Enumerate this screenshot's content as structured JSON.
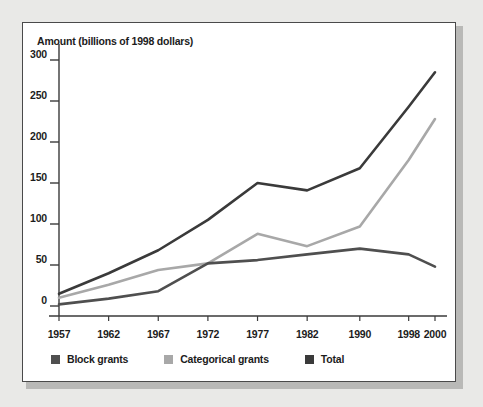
{
  "figure": {
    "panel_background": "#ffffff",
    "page_background": "#e9e9e7",
    "border_color": "#4a4a4a"
  },
  "chart_data": {
    "type": "line",
    "title": "Amount (billions of 1998 dollars)",
    "xlabel": "",
    "ylabel": "Amount (billions of 1998 dollars)",
    "categories": [
      "1957",
      "1962",
      "1967",
      "1972",
      "1977",
      "1982",
      "1990",
      "1998",
      "2000"
    ],
    "x": [
      1957,
      1962,
      1967,
      1972,
      1977,
      1982,
      1990,
      1998,
      2000
    ],
    "ylim": [
      0,
      300
    ],
    "yticks": [
      0,
      50,
      100,
      150,
      200,
      250,
      300
    ],
    "grid": false,
    "legend_position": "bottom-left",
    "series": [
      {
        "name": "Block grants",
        "color": "#4f4f4f",
        "values": [
          2,
          9,
          18,
          52,
          56,
          63,
          70,
          63,
          48
        ]
      },
      {
        "name": "Categorical grants",
        "color": "#a8a8a8",
        "values": [
          10,
          26,
          44,
          52,
          88,
          73,
          97,
          178,
          228
        ]
      },
      {
        "name": "Total",
        "color": "#3a3a3a",
        "values": [
          15,
          40,
          68,
          105,
          150,
          141,
          168,
          243,
          285
        ]
      }
    ]
  },
  "legend": {
    "items": [
      {
        "label": "Block grants",
        "color": "#4f4f4f"
      },
      {
        "label": "Categorical grants",
        "color": "#a8a8a8"
      },
      {
        "label": "Total",
        "color": "#3a3a3a"
      }
    ]
  }
}
